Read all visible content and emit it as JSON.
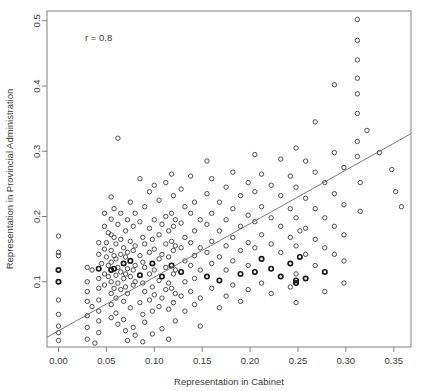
{
  "chart_data": {
    "type": "scatter",
    "title": "",
    "xlabel": "Representation in Cabinet",
    "ylabel": "Representation in Provincial Administration",
    "annotation": "r = 0.8",
    "correlation": 0.8,
    "xlim": [
      -0.012,
      0.368
    ],
    "ylim": [
      0.0,
      0.515
    ],
    "xticks": [
      0.0,
      0.05,
      0.1,
      0.15,
      0.2,
      0.25,
      0.3,
      0.35
    ],
    "xticklabels": [
      "0.00",
      "0.05",
      "0.10",
      "0.15",
      "0.20",
      "0.25",
      "0.30",
      "0.35"
    ],
    "yticks": [
      0.1,
      0.2,
      0.3,
      0.4,
      0.5
    ],
    "yticklabels": [
      "0.1",
      "0.2",
      "0.3",
      "0.4",
      "0.5"
    ],
    "grid": false,
    "legend": null,
    "marker": "open-circle",
    "point_color": "#3c3c3c",
    "line_color": "#6b6b6b",
    "frame_color": "#808080",
    "fit_line": {
      "x0": -0.012,
      "y0": 0.015,
      "x1": 0.368,
      "y1": 0.327
    },
    "points": [
      [
        0.0,
        0.17
      ],
      [
        0.0,
        0.145
      ],
      [
        0.0,
        0.14
      ],
      [
        0.0,
        0.118
      ],
      [
        0.0,
        0.1
      ],
      [
        0.0,
        0.072
      ],
      [
        0.0,
        0.05
      ],
      [
        0.0,
        0.032
      ],
      [
        0.0,
        0.022
      ],
      [
        0.0,
        0.01
      ],
      [
        0.03,
        0.122
      ],
      [
        0.03,
        0.1
      ],
      [
        0.03,
        0.085
      ],
      [
        0.03,
        0.07
      ],
      [
        0.03,
        0.048
      ],
      [
        0.03,
        0.03
      ],
      [
        0.03,
        0.012
      ],
      [
        0.035,
        0.118
      ],
      [
        0.035,
        0.062
      ],
      [
        0.038,
        0.006
      ],
      [
        0.042,
        0.16
      ],
      [
        0.042,
        0.142
      ],
      [
        0.042,
        0.12
      ],
      [
        0.042,
        0.105
      ],
      [
        0.042,
        0.09
      ],
      [
        0.042,
        0.072
      ],
      [
        0.042,
        0.055
      ],
      [
        0.042,
        0.04
      ],
      [
        0.042,
        0.022
      ],
      [
        0.045,
        0.128
      ],
      [
        0.048,
        0.205
      ],
      [
        0.048,
        0.185
      ],
      [
        0.048,
        0.15
      ],
      [
        0.048,
        0.112
      ],
      [
        0.048,
        0.095
      ],
      [
        0.05,
        0.16
      ],
      [
        0.05,
        0.138
      ],
      [
        0.052,
        0.175
      ],
      [
        0.052,
        0.125
      ],
      [
        0.052,
        0.108
      ],
      [
        0.055,
        0.23
      ],
      [
        0.055,
        0.196
      ],
      [
        0.055,
        0.172
      ],
      [
        0.055,
        0.148
      ],
      [
        0.055,
        0.13
      ],
      [
        0.055,
        0.118
      ],
      [
        0.055,
        0.1
      ],
      [
        0.055,
        0.082
      ],
      [
        0.055,
        0.065
      ],
      [
        0.055,
        0.045
      ],
      [
        0.058,
        0.212
      ],
      [
        0.058,
        0.168
      ],
      [
        0.058,
        0.14
      ],
      [
        0.058,
        0.12
      ],
      [
        0.058,
        0.09
      ],
      [
        0.06,
        0.158
      ],
      [
        0.06,
        0.135
      ],
      [
        0.06,
        0.11
      ],
      [
        0.06,
        0.075
      ],
      [
        0.06,
        0.052
      ],
      [
        0.062,
        0.32
      ],
      [
        0.062,
        0.188
      ],
      [
        0.062,
        0.122
      ],
      [
        0.062,
        0.098
      ],
      [
        0.062,
        0.035
      ],
      [
        0.065,
        0.205
      ],
      [
        0.065,
        0.165
      ],
      [
        0.065,
        0.142
      ],
      [
        0.065,
        0.115
      ],
      [
        0.065,
        0.088
      ],
      [
        0.068,
        0.152
      ],
      [
        0.068,
        0.128
      ],
      [
        0.068,
        0.105
      ],
      [
        0.068,
        0.07
      ],
      [
        0.068,
        0.042
      ],
      [
        0.07,
        0.178
      ],
      [
        0.07,
        0.138
      ],
      [
        0.07,
        0.112
      ],
      [
        0.07,
        0.092
      ],
      [
        0.07,
        0.025
      ],
      [
        0.072,
        0.195
      ],
      [
        0.072,
        0.145
      ],
      [
        0.072,
        0.12
      ],
      [
        0.072,
        0.082
      ],
      [
        0.072,
        0.01
      ],
      [
        0.075,
        0.222
      ],
      [
        0.075,
        0.162
      ],
      [
        0.075,
        0.132
      ],
      [
        0.075,
        0.108
      ],
      [
        0.075,
        0.06
      ],
      [
        0.078,
        0.185
      ],
      [
        0.078,
        0.148
      ],
      [
        0.078,
        0.118
      ],
      [
        0.078,
        0.095
      ],
      [
        0.078,
        0.03
      ],
      [
        0.08,
        0.205
      ],
      [
        0.08,
        0.155
      ],
      [
        0.08,
        0.125
      ],
      [
        0.08,
        0.1
      ],
      [
        0.08,
        0.018
      ],
      [
        0.085,
        0.258
      ],
      [
        0.085,
        0.192
      ],
      [
        0.085,
        0.14
      ],
      [
        0.085,
        0.11
      ],
      [
        0.085,
        0.068
      ],
      [
        0.088,
        0.168
      ],
      [
        0.088,
        0.13
      ],
      [
        0.088,
        0.098
      ],
      [
        0.088,
        0.05
      ],
      [
        0.088,
        0.008
      ],
      [
        0.09,
        0.215
      ],
      [
        0.09,
        0.158
      ],
      [
        0.09,
        0.122
      ],
      [
        0.09,
        0.085
      ],
      [
        0.09,
        0.038
      ],
      [
        0.095,
        0.238
      ],
      [
        0.095,
        0.182
      ],
      [
        0.095,
        0.145
      ],
      [
        0.095,
        0.112
      ],
      [
        0.095,
        0.072
      ],
      [
        0.098,
        0.165
      ],
      [
        0.098,
        0.128
      ],
      [
        0.098,
        0.092
      ],
      [
        0.098,
        0.055
      ],
      [
        0.098,
        0.02
      ],
      [
        0.1,
        0.248
      ],
      [
        0.1,
        0.195
      ],
      [
        0.1,
        0.15
      ],
      [
        0.1,
        0.118
      ],
      [
        0.1,
        0.08
      ],
      [
        0.105,
        0.225
      ],
      [
        0.105,
        0.172
      ],
      [
        0.105,
        0.135
      ],
      [
        0.105,
        0.102
      ],
      [
        0.105,
        0.062
      ],
      [
        0.108,
        0.188
      ],
      [
        0.108,
        0.142
      ],
      [
        0.108,
        0.108
      ],
      [
        0.108,
        0.075
      ],
      [
        0.108,
        0.028
      ],
      [
        0.112,
        0.252
      ],
      [
        0.112,
        0.2
      ],
      [
        0.112,
        0.158
      ],
      [
        0.112,
        0.122
      ],
      [
        0.112,
        0.088
      ],
      [
        0.115,
        0.178
      ],
      [
        0.115,
        0.138
      ],
      [
        0.115,
        0.098
      ],
      [
        0.115,
        0.058
      ],
      [
        0.115,
        0.012
      ],
      [
        0.118,
        0.265
      ],
      [
        0.118,
        0.205
      ],
      [
        0.118,
        0.162
      ],
      [
        0.118,
        0.125
      ],
      [
        0.118,
        0.09
      ],
      [
        0.12,
        0.232
      ],
      [
        0.12,
        0.185
      ],
      [
        0.12,
        0.148
      ],
      [
        0.12,
        0.112
      ],
      [
        0.12,
        0.068
      ],
      [
        0.122,
        0.195
      ],
      [
        0.122,
        0.155
      ],
      [
        0.122,
        0.118
      ],
      [
        0.122,
        0.082
      ],
      [
        0.122,
        0.04
      ],
      [
        0.128,
        0.242
      ],
      [
        0.128,
        0.19
      ],
      [
        0.128,
        0.152
      ],
      [
        0.128,
        0.115
      ],
      [
        0.128,
        0.078
      ],
      [
        0.132,
        0.215
      ],
      [
        0.132,
        0.168
      ],
      [
        0.132,
        0.132
      ],
      [
        0.132,
        0.1
      ],
      [
        0.132,
        0.055
      ],
      [
        0.138,
        0.262
      ],
      [
        0.138,
        0.205
      ],
      [
        0.138,
        0.16
      ],
      [
        0.138,
        0.125
      ],
      [
        0.138,
        0.085
      ],
      [
        0.142,
        0.222
      ],
      [
        0.142,
        0.178
      ],
      [
        0.142,
        0.14
      ],
      [
        0.142,
        0.105
      ],
      [
        0.142,
        0.065
      ],
      [
        0.148,
        0.195
      ],
      [
        0.148,
        0.152
      ],
      [
        0.148,
        0.118
      ],
      [
        0.148,
        0.075
      ],
      [
        0.148,
        0.032
      ],
      [
        0.155,
        0.285
      ],
      [
        0.155,
        0.235
      ],
      [
        0.155,
        0.188
      ],
      [
        0.155,
        0.145
      ],
      [
        0.155,
        0.108
      ],
      [
        0.16,
        0.258
      ],
      [
        0.16,
        0.205
      ],
      [
        0.16,
        0.162
      ],
      [
        0.16,
        0.128
      ],
      [
        0.16,
        0.09
      ],
      [
        0.168,
        0.222
      ],
      [
        0.168,
        0.178
      ],
      [
        0.168,
        0.138
      ],
      [
        0.168,
        0.102
      ],
      [
        0.168,
        0.06
      ],
      [
        0.175,
        0.245
      ],
      [
        0.175,
        0.195
      ],
      [
        0.175,
        0.155
      ],
      [
        0.175,
        0.118
      ],
      [
        0.175,
        0.078
      ],
      [
        0.182,
        0.268
      ],
      [
        0.182,
        0.212
      ],
      [
        0.182,
        0.168
      ],
      [
        0.182,
        0.132
      ],
      [
        0.182,
        0.095
      ],
      [
        0.19,
        0.232
      ],
      [
        0.19,
        0.185
      ],
      [
        0.19,
        0.148
      ],
      [
        0.19,
        0.112
      ],
      [
        0.19,
        0.07
      ],
      [
        0.198,
        0.252
      ],
      [
        0.198,
        0.202
      ],
      [
        0.198,
        0.16
      ],
      [
        0.198,
        0.125
      ],
      [
        0.198,
        0.088
      ],
      [
        0.205,
        0.295
      ],
      [
        0.205,
        0.238
      ],
      [
        0.205,
        0.192
      ],
      [
        0.205,
        0.152
      ],
      [
        0.205,
        0.115
      ],
      [
        0.212,
        0.265
      ],
      [
        0.212,
        0.215
      ],
      [
        0.212,
        0.172
      ],
      [
        0.212,
        0.135
      ],
      [
        0.212,
        0.098
      ],
      [
        0.222,
        0.248
      ],
      [
        0.222,
        0.198
      ],
      [
        0.222,
        0.158
      ],
      [
        0.222,
        0.12
      ],
      [
        0.222,
        0.082
      ],
      [
        0.232,
        0.288
      ],
      [
        0.232,
        0.232
      ],
      [
        0.232,
        0.185
      ],
      [
        0.232,
        0.145
      ],
      [
        0.232,
        0.108
      ],
      [
        0.242,
        0.262
      ],
      [
        0.242,
        0.212
      ],
      [
        0.242,
        0.168
      ],
      [
        0.242,
        0.128
      ],
      [
        0.242,
        0.092
      ],
      [
        0.248,
        0.305
      ],
      [
        0.248,
        0.245
      ],
      [
        0.248,
        0.198
      ],
      [
        0.248,
        0.155
      ],
      [
        0.248,
        0.112
      ],
      [
        0.248,
        0.102
      ],
      [
        0.248,
        0.098
      ],
      [
        0.248,
        0.068
      ],
      [
        0.252,
        0.178
      ],
      [
        0.252,
        0.138
      ],
      [
        0.258,
        0.285
      ],
      [
        0.258,
        0.228
      ],
      [
        0.258,
        0.182
      ],
      [
        0.258,
        0.142
      ],
      [
        0.258,
        0.105
      ],
      [
        0.268,
        0.345
      ],
      [
        0.268,
        0.268
      ],
      [
        0.268,
        0.212
      ],
      [
        0.268,
        0.165
      ],
      [
        0.268,
        0.125
      ],
      [
        0.278,
        0.252
      ],
      [
        0.278,
        0.198
      ],
      [
        0.278,
        0.152
      ],
      [
        0.278,
        0.115
      ],
      [
        0.278,
        0.085
      ],
      [
        0.288,
        0.402
      ],
      [
        0.288,
        0.298
      ],
      [
        0.288,
        0.235
      ],
      [
        0.288,
        0.185
      ],
      [
        0.288,
        0.142
      ],
      [
        0.298,
        0.275
      ],
      [
        0.298,
        0.218
      ],
      [
        0.298,
        0.172
      ],
      [
        0.298,
        0.132
      ],
      [
        0.298,
        0.098
      ],
      [
        0.312,
        0.502
      ],
      [
        0.312,
        0.47
      ],
      [
        0.312,
        0.44
      ],
      [
        0.312,
        0.412
      ],
      [
        0.312,
        0.388
      ],
      [
        0.312,
        0.358
      ],
      [
        0.312,
        0.315
      ],
      [
        0.312,
        0.292
      ],
      [
        0.315,
        0.252
      ],
      [
        0.315,
        0.208
      ],
      [
        0.322,
        0.332
      ],
      [
        0.335,
        0.298
      ],
      [
        0.348,
        0.272
      ],
      [
        0.352,
        0.238
      ],
      [
        0.358,
        0.215
      ]
    ],
    "bold_points": [
      [
        0.0,
        0.118
      ],
      [
        0.0,
        0.1
      ],
      [
        0.042,
        0.12
      ],
      [
        0.055,
        0.118
      ],
      [
        0.058,
        0.12
      ],
      [
        0.068,
        0.128
      ],
      [
        0.075,
        0.132
      ],
      [
        0.085,
        0.11
      ],
      [
        0.098,
        0.128
      ],
      [
        0.108,
        0.108
      ],
      [
        0.118,
        0.125
      ],
      [
        0.128,
        0.115
      ],
      [
        0.155,
        0.108
      ],
      [
        0.168,
        0.102
      ],
      [
        0.19,
        0.112
      ],
      [
        0.205,
        0.115
      ],
      [
        0.212,
        0.135
      ],
      [
        0.222,
        0.12
      ],
      [
        0.232,
        0.108
      ],
      [
        0.242,
        0.128
      ],
      [
        0.248,
        0.102
      ],
      [
        0.248,
        0.098
      ],
      [
        0.252,
        0.138
      ],
      [
        0.258,
        0.105
      ],
      [
        0.278,
        0.115
      ]
    ]
  }
}
